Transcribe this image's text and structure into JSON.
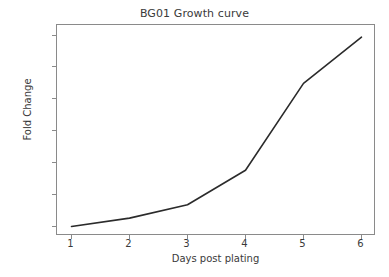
{
  "chart_data": {
    "type": "line",
    "title": "BG01 Growth curve",
    "xlabel": "Days post plating",
    "ylabel": "Fold Change",
    "x": [
      1,
      2,
      3,
      4,
      5,
      6
    ],
    "values": [
      2,
      28,
      70,
      178,
      450,
      595
    ],
    "xticks": [
      "1",
      "2",
      "3",
      "4",
      "5",
      "6"
    ],
    "yticks": [
      "0",
      "100",
      "200",
      "300",
      "400",
      "500",
      "600"
    ],
    "ytick_values": [
      0,
      100,
      200,
      300,
      400,
      500,
      600
    ],
    "xlim": [
      0.75,
      6.25
    ],
    "ylim": [
      -28,
      633
    ],
    "grid": false,
    "legend": null,
    "line_color": "#2b2b2b",
    "line_width": 1.6,
    "markers": false,
    "axis_color": "#8a8a8a",
    "text_color": "#3a3a3a",
    "background": "#ffffff"
  }
}
